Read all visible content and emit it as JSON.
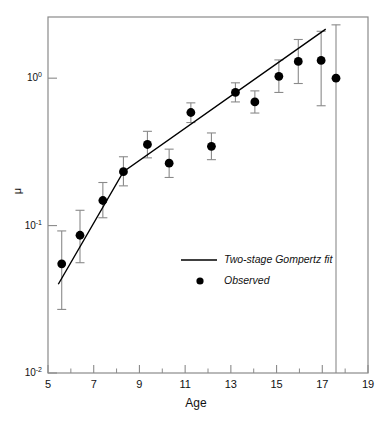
{
  "chart_data": {
    "type": "scatter",
    "title": "",
    "xlabel": "Age",
    "ylabel": "μ",
    "xlim": [
      5,
      19
    ],
    "ylim": [
      0.01,
      2.6
    ],
    "yscale": "log",
    "xscale": "linear",
    "grid": false,
    "xticks": [
      5,
      7,
      9,
      11,
      13,
      15,
      17,
      19
    ],
    "xtick_labels": [
      "5",
      "7",
      "9",
      "11",
      "13",
      "15",
      "17",
      "19"
    ],
    "xminor_ticks": [
      6,
      8,
      10,
      12,
      14,
      16,
      18
    ],
    "yticks": [
      1,
      0.1,
      0.01
    ],
    "ytick_labels": [
      "10⁰",
      "10⁻¹",
      "10⁻²"
    ],
    "ytick_mantissas": [
      "10",
      "10",
      "10"
    ],
    "ytick_exponents": [
      "0",
      "-1",
      "-2"
    ],
    "legend_position": "center",
    "legend": [
      {
        "label": "Two-stage Gompertz fit",
        "marker": "line"
      },
      {
        "label": "Observed",
        "marker": "dot"
      }
    ],
    "series": [
      {
        "name": "Observed",
        "marker": "dot",
        "points": [
          {
            "x": 5.6,
            "y": 0.055,
            "ylow": 0.027,
            "yhigh": 0.092
          },
          {
            "x": 6.4,
            "y": 0.086,
            "ylow": 0.056,
            "yhigh": 0.127
          },
          {
            "x": 7.4,
            "y": 0.148,
            "ylow": 0.113,
            "yhigh": 0.196
          },
          {
            "x": 8.3,
            "y": 0.232,
            "ylow": 0.186,
            "yhigh": 0.293
          },
          {
            "x": 9.35,
            "y": 0.355,
            "ylow": 0.288,
            "yhigh": 0.436
          },
          {
            "x": 10.3,
            "y": 0.265,
            "ylow": 0.212,
            "yhigh": 0.33
          },
          {
            "x": 11.25,
            "y": 0.585,
            "ylow": 0.5,
            "yhigh": 0.68
          },
          {
            "x": 12.15,
            "y": 0.345,
            "ylow": 0.28,
            "yhigh": 0.425
          },
          {
            "x": 13.2,
            "y": 0.8,
            "ylow": 0.69,
            "yhigh": 0.93
          },
          {
            "x": 14.05,
            "y": 0.69,
            "ylow": 0.58,
            "yhigh": 0.82
          },
          {
            "x": 15.1,
            "y": 1.03,
            "ylow": 0.8,
            "yhigh": 1.33
          },
          {
            "x": 15.95,
            "y": 1.3,
            "ylow": 0.92,
            "yhigh": 1.83
          },
          {
            "x": 16.95,
            "y": 1.32,
            "ylow": 0.65,
            "yhigh": 2.08
          },
          {
            "x": 17.6,
            "y": 1.0,
            "ylow": 0.01,
            "yhigh": 2.3
          }
        ]
      },
      {
        "name": "Two-stage Gompertz fit",
        "marker": "line",
        "points": [
          {
            "x": 5.45,
            "y": 0.04
          },
          {
            "x": 8.3,
            "y": 0.232
          },
          {
            "x": 17.15,
            "y": 2.15
          }
        ]
      }
    ]
  },
  "style": {
    "axis_color": "#8a8a8a",
    "ink_color": "#111111",
    "marker_color": "#000000",
    "error_color": "#8a8a8a",
    "background": "#ffffff"
  },
  "axis_label_x": "Age",
  "axis_label_y": "μ"
}
